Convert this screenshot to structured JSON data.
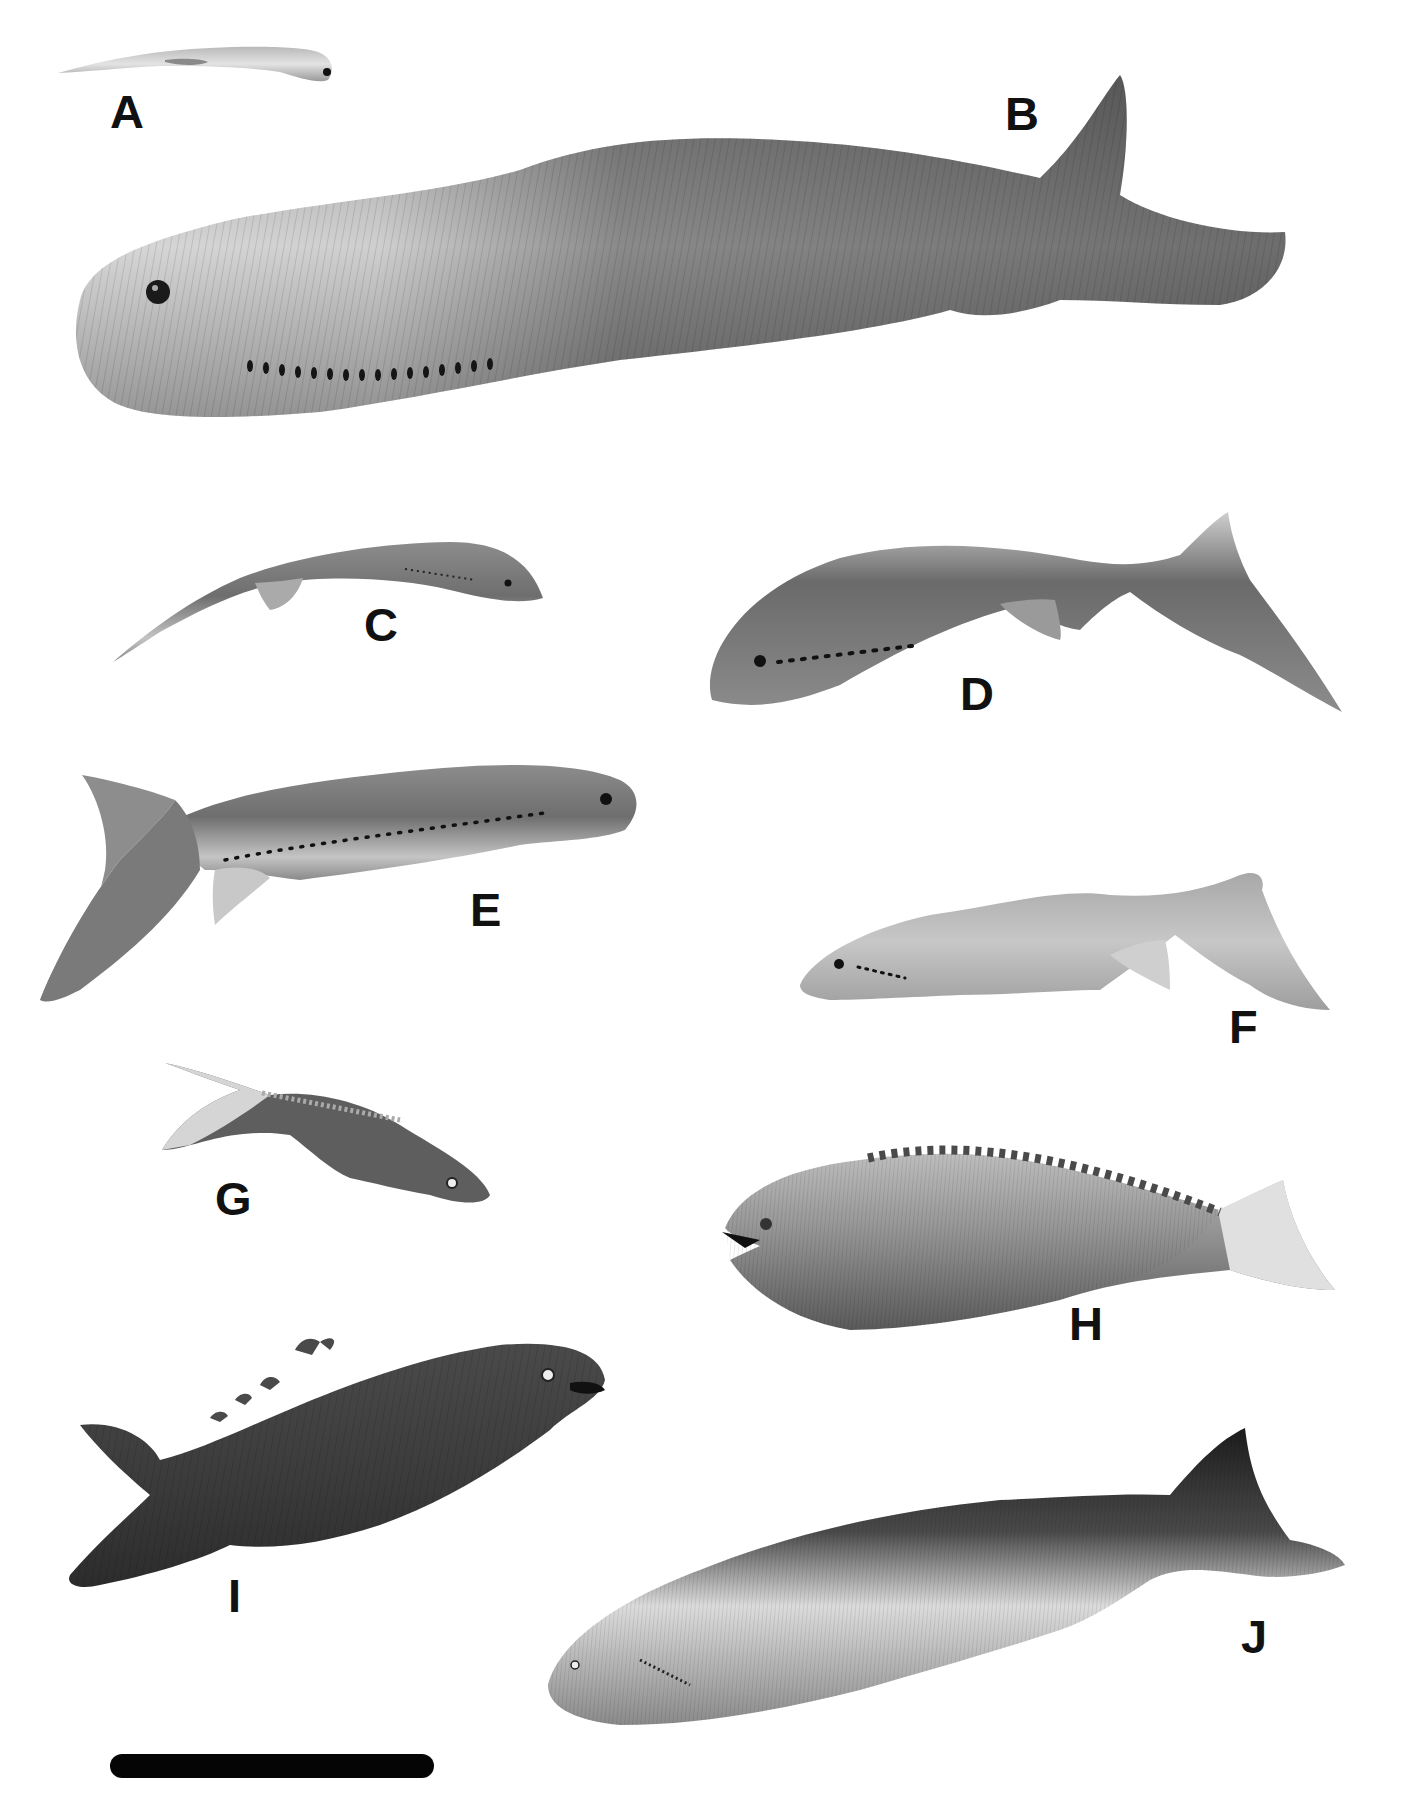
{
  "figure": {
    "type": "paleontological reconstruction plate",
    "background": "#ffffff",
    "specimens": [
      {
        "id": "A",
        "label": "A",
        "description": "small slender eel-like fish, pale, head on right"
      },
      {
        "id": "B",
        "label": "B",
        "description": "large heavy-bodied jawless fish with row of gill openings, striped back, upturned tail"
      },
      {
        "id": "C",
        "label": "C",
        "description": "slender elongate fish, curved body, head on right, small pelvic fin"
      },
      {
        "id": "D",
        "label": "D",
        "description": "fish with dorsal row of gill openings, head on left, forked hypocercal tail"
      },
      {
        "id": "E",
        "label": "E",
        "description": "stout fish facing right, long row of gill openings, large lower tail lobe"
      },
      {
        "id": "F",
        "label": "F",
        "description": "pale mottled fish facing left, short gill row, forked tail"
      },
      {
        "id": "G",
        "label": "G",
        "description": "small dark armored fish facing right with dorsal scutes"
      },
      {
        "id": "H",
        "label": "H",
        "description": "banded fish facing left with open mouth and dorsal scute row"
      },
      {
        "id": "I",
        "label": "I",
        "description": "dark armored fish facing right with hooked dorsal spines"
      },
      {
        "id": "J",
        "label": "J",
        "description": "large fish facing left, finely striated body, dark dorsal surface"
      }
    ],
    "colors": {
      "label": "#111111",
      "scale_bar": "#050505",
      "pale_body": "#c9c9c9",
      "mid_body": "#7a7a7a",
      "dark_body": "#3e3e3e"
    },
    "scale_bar": {
      "visible": true,
      "label": ""
    }
  }
}
